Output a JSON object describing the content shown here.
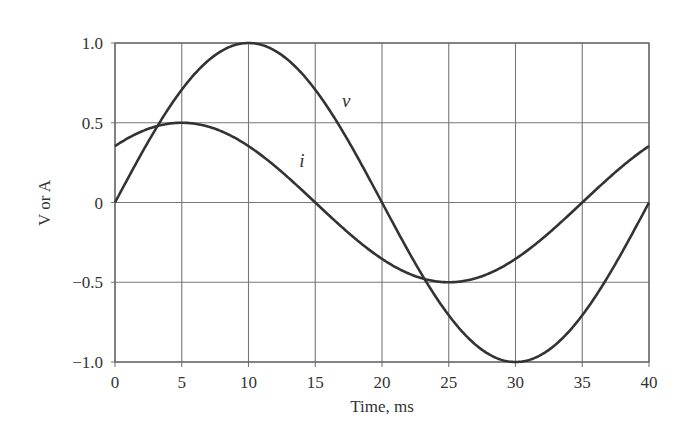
{
  "chart_data": {
    "type": "line",
    "title": "",
    "xlabel": "Time, ms",
    "ylabel": "V or A",
    "xlim": [
      0,
      40
    ],
    "ylim": [
      -1.0,
      1.0
    ],
    "grid": true,
    "legend": "inline labels",
    "x_ticks": [
      "0",
      "5",
      "10",
      "15",
      "20",
      "25",
      "30",
      "35",
      "40"
    ],
    "y_ticks": [
      "1.0",
      "0.5",
      "0",
      "−0.5",
      "−1.0"
    ],
    "x_tick_values": [
      0,
      5,
      10,
      15,
      20,
      25,
      30,
      35,
      40
    ],
    "y_tick_values": [
      1.0,
      0.5,
      0,
      -0.5,
      -1.0
    ],
    "series": [
      {
        "name": "v",
        "label": "v",
        "description": "v(t) = 1.0 sin(2π·25t), period 40 ms, peak 1.0 at 10 ms, min -1.0 at 30 ms",
        "amplitude": 1.0,
        "period_ms": 40,
        "phase_deg": 0,
        "x": [
          0,
          5,
          10,
          15,
          20,
          25,
          30,
          35,
          40
        ],
        "values": [
          0,
          0.707,
          1.0,
          0.707,
          0,
          -0.707,
          -1.0,
          -0.707,
          0
        ],
        "label_pos": {
          "t": 17,
          "y": 0.6
        }
      },
      {
        "name": "i",
        "label": "i",
        "description": "i(t) = 0.5 sin(2π·25t + 45°), peak 0.5 at 5 ms, min -0.5 at 25 ms",
        "amplitude": 0.5,
        "period_ms": 40,
        "phase_deg": 45,
        "x": [
          0,
          5,
          10,
          15,
          20,
          25,
          30,
          35,
          40
        ],
        "values": [
          0.354,
          0.5,
          0.354,
          0,
          -0.354,
          -0.5,
          -0.354,
          0,
          0.354
        ],
        "label_pos": {
          "t": 13.8,
          "y": 0.22
        }
      }
    ]
  }
}
